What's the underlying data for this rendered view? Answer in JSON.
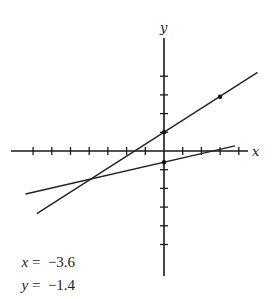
{
  "axes": {
    "x_label": "x",
    "y_label": "y",
    "origin_px": [
      164,
      151
    ],
    "unit_px": 18.7,
    "x_ticks": [
      -7,
      -6,
      -5,
      -4,
      -3,
      -2,
      -1,
      1,
      2,
      3,
      4
    ],
    "y_ticks": [
      -5,
      -4,
      -3,
      -2,
      -1,
      1,
      2,
      3,
      4
    ]
  },
  "lines": [
    {
      "name": "steeper-line",
      "slope": 0.64,
      "intercept": 1.0,
      "x_range": [
        -6.8,
        5.0
      ],
      "points": [
        [
          0,
          1.0
        ],
        [
          3,
          2.9
        ]
      ]
    },
    {
      "name": "flatter-line",
      "slope": 0.23,
      "intercept": -0.6,
      "x_range": [
        -7.4,
        3.8
      ],
      "points": [
        [
          0,
          -0.6
        ]
      ]
    }
  ],
  "solution": {
    "x_line": {
      "var": "x",
      "eq": " =  ",
      "value": "−3.6"
    },
    "y_line": {
      "var": "y",
      "eq": " =  ",
      "value": "−1.4"
    }
  },
  "colors": {
    "ink": "#1a1a1a",
    "background": "#ffffff"
  }
}
